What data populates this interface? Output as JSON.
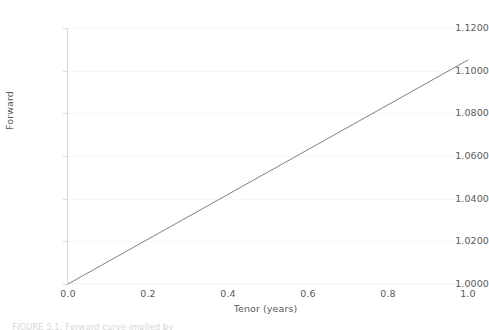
{
  "chart_data": {
    "type": "line",
    "title": "",
    "subtitle": "",
    "xlabel": "Tenor (years)",
    "ylabel": "Forward",
    "xlim": [
      0.0,
      1.0
    ],
    "ylim": [
      1.0,
      1.12
    ],
    "grid": true,
    "grid_axis": "y",
    "legend": false,
    "legend_position": "none",
    "x_ticks": [
      0.0,
      0.2,
      0.4,
      0.6,
      0.8,
      1.0
    ],
    "x_tick_labels": [
      "0.0",
      "0.2",
      "0.4",
      "0.6",
      "0.8",
      "1.0"
    ],
    "y_ticks": [
      1.0,
      1.02,
      1.04,
      1.06,
      1.08,
      1.1,
      1.12
    ],
    "y_tick_labels": [
      "1.0000",
      "1.0200",
      "1.0400",
      "1.0600",
      "1.0800",
      "1.1000",
      "1.1200"
    ],
    "series": [
      {
        "name": "Forward",
        "color": "#808080",
        "line_width": 1.0,
        "x": [
          0.0,
          0.1,
          0.2,
          0.3,
          0.4,
          0.5,
          0.6,
          0.7,
          0.8,
          0.9,
          1.0
        ],
        "values": [
          1.0,
          1.0105,
          1.021,
          1.0315,
          1.042,
          1.0525,
          1.063,
          1.0735,
          1.084,
          1.0945,
          1.105
        ]
      }
    ],
    "annotations": []
  },
  "caption": {
    "text": "FIGURE 5.1: Forward curve implied by"
  },
  "colors": {
    "background": "#ffffff",
    "axis": "#d9d9d9",
    "grid": "#f7f7f7",
    "text": "#5a5a5a",
    "series": "#808080"
  }
}
